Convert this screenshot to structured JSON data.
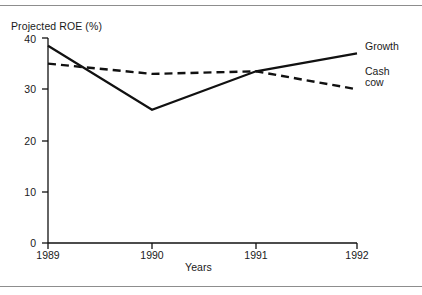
{
  "figure": {
    "background": "#ffffff",
    "line_color": "#111111",
    "rule_color": "#8d8d8d"
  },
  "axes": {
    "y_title": "Projected ROE (%)",
    "x_title": "Years",
    "y_ticks": [
      "0",
      "10",
      "20",
      "30",
      "40"
    ],
    "x_ticks": [
      "1989",
      "1990",
      "1991",
      "1992"
    ]
  },
  "series_labels": {
    "growth": "Growth",
    "cash_cow_line1": "Cash",
    "cash_cow_line2": "cow"
  },
  "chart_data": {
    "type": "line",
    "title": "",
    "subtitle": "",
    "xlabel": "Years",
    "ylabel": "Projected ROE (%)",
    "categories": [
      "1989",
      "1990",
      "1991",
      "1992"
    ],
    "x": [
      1989,
      1990,
      1991,
      1992
    ],
    "xlim": [
      1989,
      1992
    ],
    "ylim": [
      0,
      40
    ],
    "yticks": [
      0,
      10,
      20,
      30,
      40
    ],
    "xticks": [
      1989,
      1990,
      1991,
      1992
    ],
    "grid": false,
    "legend": "inline-right",
    "series": [
      {
        "name": "Growth",
        "style": "solid",
        "color": "#111111",
        "values": [
          38.5,
          26,
          33.5,
          37
        ]
      },
      {
        "name": "Cash cow",
        "style": "dashed",
        "color": "#111111",
        "values": [
          35,
          33,
          33.5,
          30
        ]
      }
    ],
    "annotations": []
  }
}
